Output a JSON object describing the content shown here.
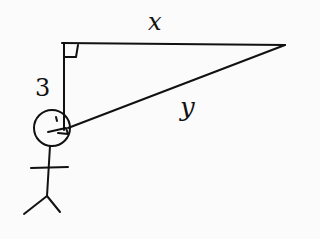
{
  "diagram": {
    "labels": {
      "top_side": "x",
      "hypotenuse": "y",
      "vertical_side": "3"
    },
    "stroke_color": "#111111",
    "background": "#fbfbfb"
  }
}
